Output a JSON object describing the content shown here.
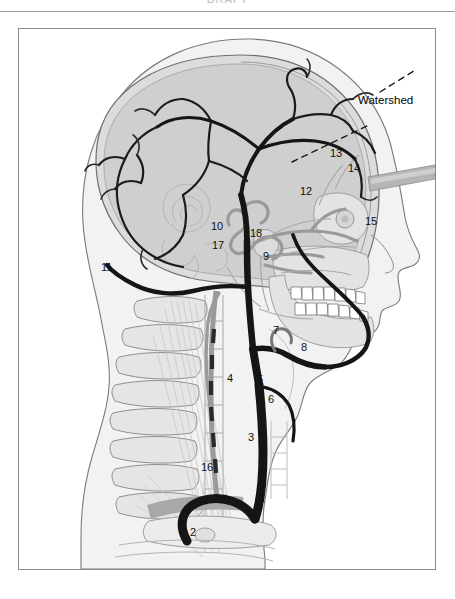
{
  "page": {
    "header_text": "DRAFT",
    "background_color": "#ffffff"
  },
  "figure": {
    "frame_color": "#8d8d8d",
    "palette": {
      "skin_fill": "#f1f1f1",
      "skull_fill": "#d8d8d8",
      "brain_fill": "#cfcfcf",
      "bone_fill": "#e3e3e3",
      "artery_dark": "#161616",
      "artery_gray": "#9a9a9a",
      "outline": "#6e6e6e",
      "tooth_fill": "#ffffff",
      "bar_fill": "#b0b0b0"
    },
    "annotations": [
      {
        "id": "watershed",
        "text": "Watershed",
        "x": 357,
        "y": 94,
        "type": "text-callout"
      }
    ],
    "labels": [
      {
        "id": "1",
        "text": "1",
        "x": 258,
        "y": 492
      },
      {
        "id": "2",
        "text": "2",
        "x": 189,
        "y": 526
      },
      {
        "id": "3",
        "text": "3",
        "x": 247,
        "y": 431
      },
      {
        "id": "4",
        "text": "4",
        "x": 226,
        "y": 372
      },
      {
        "id": "5",
        "text": "5",
        "x": 256,
        "y": 373
      },
      {
        "id": "6",
        "text": "6",
        "x": 267,
        "y": 393
      },
      {
        "id": "7",
        "text": "7",
        "x": 272,
        "y": 324
      },
      {
        "id": "8",
        "text": "8",
        "x": 300,
        "y": 341
      },
      {
        "id": "9",
        "text": "9",
        "x": 262,
        "y": 250
      },
      {
        "id": "10",
        "text": "10",
        "x": 213,
        "y": 220
      },
      {
        "id": "11",
        "text": "11",
        "x": 100,
        "y": 261
      },
      {
        "id": "12",
        "text": "12",
        "x": 299,
        "y": 185
      },
      {
        "id": "13",
        "text": "13",
        "x": 329,
        "y": 147
      },
      {
        "id": "14",
        "text": "14",
        "x": 347,
        "y": 162
      },
      {
        "id": "15",
        "text": "15",
        "x": 364,
        "y": 215
      },
      {
        "id": "16",
        "text": "16",
        "x": 200,
        "y": 461
      },
      {
        "id": "17",
        "text": "17",
        "x": 211,
        "y": 239
      },
      {
        "id": "18",
        "text": "18",
        "x": 249,
        "y": 227
      }
    ]
  }
}
